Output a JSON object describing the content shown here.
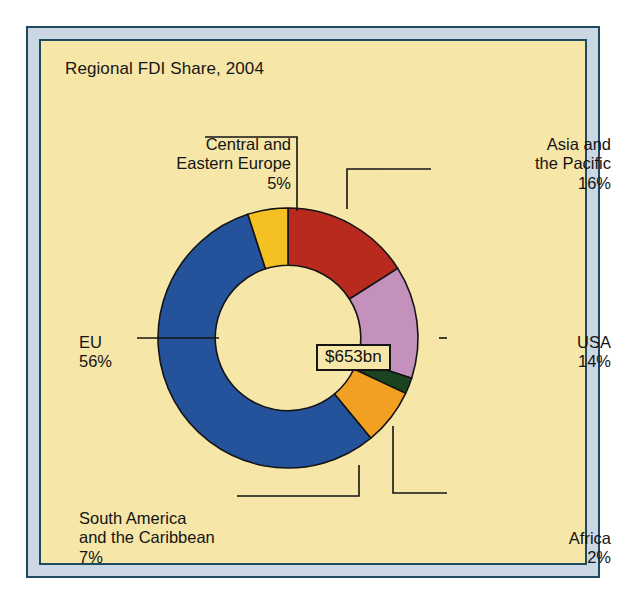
{
  "figure": {
    "title": "Regional FDI Share, 2004",
    "centre_value": "$653bn"
  },
  "labels": {
    "cee": {
      "name": "Central and\nEastern Europe",
      "pct": "5%"
    },
    "asia": {
      "name": "Asia and\nthe Pacific",
      "pct": "16%"
    },
    "usa": {
      "name": "USA",
      "pct": "14%"
    },
    "eu": {
      "name": "EU",
      "pct": "56%"
    },
    "sa": {
      "name": "South America\nand the Caribbean",
      "pct": "7%"
    },
    "africa": {
      "name": "Africa",
      "pct": "2%"
    }
  },
  "colors": {
    "page_background": "#ffffff",
    "mat": "#ccd7e4",
    "frame_rule": "#1d4a5e",
    "panel": "#f6e6a8",
    "text": "#141414",
    "leader_line": "#141414",
    "asia": "#b92a1e",
    "usa": "#c490bc",
    "africa": "#1a4420",
    "south_america": "#f2a022",
    "eu": "#24539c",
    "cee": "#f5c021"
  },
  "chart_data": {
    "type": "pie",
    "title": "Regional FDI Share, 2004",
    "subtitle": "",
    "xlabel": "",
    "ylabel": "",
    "center_label": "$653bn",
    "total": 653,
    "total_units": "US$ bn",
    "grid": false,
    "legend": "callout-labels",
    "donut": true,
    "inner_radius_ratio": 0.56,
    "start_angle_deg": 0,
    "direction": "clockwise",
    "categories": [
      "Asia and the Pacific",
      "USA",
      "Africa",
      "South America and the Caribbean",
      "EU",
      "Central and Eastern Europe"
    ],
    "values": [
      16,
      14,
      2,
      7,
      56,
      5
    ],
    "value_unit": "percent",
    "slices": [
      {
        "label": "Asia and the Pacific",
        "value": 16,
        "display": "16%",
        "color": "#b92a1e"
      },
      {
        "label": "USA",
        "value": 14,
        "display": "14%",
        "color": "#c490bc"
      },
      {
        "label": "Africa",
        "value": 2,
        "display": "2%",
        "color": "#1a4420"
      },
      {
        "label": "South America and the Caribbean",
        "value": 7,
        "display": "7%",
        "color": "#f2a022"
      },
      {
        "label": "EU",
        "value": 56,
        "display": "56%",
        "color": "#24539c"
      },
      {
        "label": "Central and Eastern Europe",
        "value": 5,
        "display": "5%",
        "color": "#f5c021"
      }
    ]
  }
}
